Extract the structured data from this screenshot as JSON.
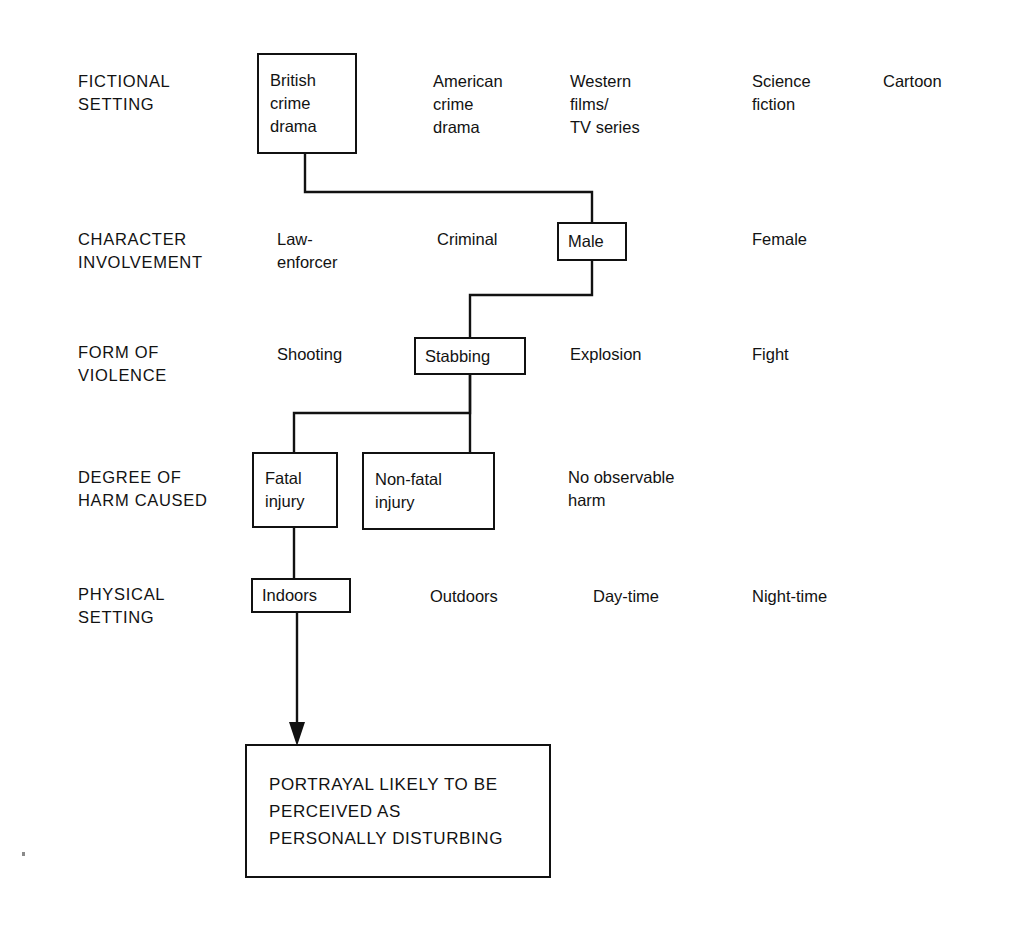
{
  "diagram": {
    "title": "Portrayal likely to be perceived as personally disturbing",
    "type": "decision-tree-flowchart",
    "line_color": "#111111",
    "background_color": "#ffffff",
    "rows": [
      {
        "label": "FICTIONAL\nSETTING",
        "options": [
          {
            "text": "British\ncrime\ndrama",
            "selected": true
          },
          {
            "text": "American\ncrime\ndrama",
            "selected": false
          },
          {
            "text": "Western\nfilms/\nTV series",
            "selected": false
          },
          {
            "text": "Science\nfiction",
            "selected": false
          },
          {
            "text": "Cartoon",
            "selected": false
          }
        ]
      },
      {
        "label": "CHARACTER\nINVOLVEMENT",
        "options": [
          {
            "text": "Law-\nenforcer",
            "selected": false
          },
          {
            "text": "Criminal",
            "selected": false
          },
          {
            "text": "Male",
            "selected": true
          },
          {
            "text": "Female",
            "selected": false
          }
        ]
      },
      {
        "label": "FORM OF\nVIOLENCE",
        "options": [
          {
            "text": "Shooting",
            "selected": false
          },
          {
            "text": "Stabbing",
            "selected": true
          },
          {
            "text": "Explosion",
            "selected": false
          },
          {
            "text": "Fight",
            "selected": false
          }
        ]
      },
      {
        "label": "DEGREE OF\nHARM CAUSED",
        "options": [
          {
            "text": "Fatal\ninjury",
            "selected": true
          },
          {
            "text": "Non-fatal\ninjury",
            "selected": true
          },
          {
            "text": "No observable\nharm",
            "selected": false
          }
        ]
      },
      {
        "label": "PHYSICAL\nSETTING",
        "options": [
          {
            "text": "Indoors",
            "selected": true
          },
          {
            "text": "Outdoors",
            "selected": false
          },
          {
            "text": "Day-time",
            "selected": false
          },
          {
            "text": "Night-time",
            "selected": false
          }
        ]
      }
    ],
    "conclusion": {
      "text": "PORTRAYAL LIKELY TO BE\nPERCEIVED AS\nPERSONALLY DISTURBING"
    }
  }
}
